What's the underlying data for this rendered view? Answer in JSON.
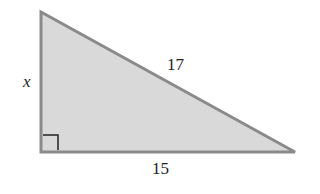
{
  "diagram": {
    "type": "right-triangle",
    "colors": {
      "fill": "#d9d9d9",
      "stroke": "#8a8a8a",
      "right_angle_mark": "#222222"
    },
    "labels": {
      "vertical_leg": "x",
      "hypotenuse": "17",
      "horizontal_leg": "15"
    }
  }
}
